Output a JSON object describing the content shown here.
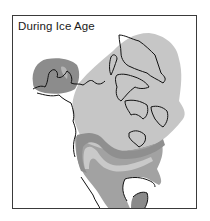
{
  "map": {
    "title": "During Ice Age",
    "colors": {
      "ice_sheet": "#c6c6c6",
      "tundra_band": "#8f8f8f",
      "pale_band": "#c9c9c9",
      "southern_land": "#a2a2a2",
      "alaska": "#8c8c8c",
      "coastline": "#111111",
      "frame": "#3a3a3a"
    },
    "regions": [
      "ice-sheet",
      "alaska-refugium",
      "tundra-band",
      "pale-band",
      "southern-land",
      "mexico-highland"
    ]
  }
}
